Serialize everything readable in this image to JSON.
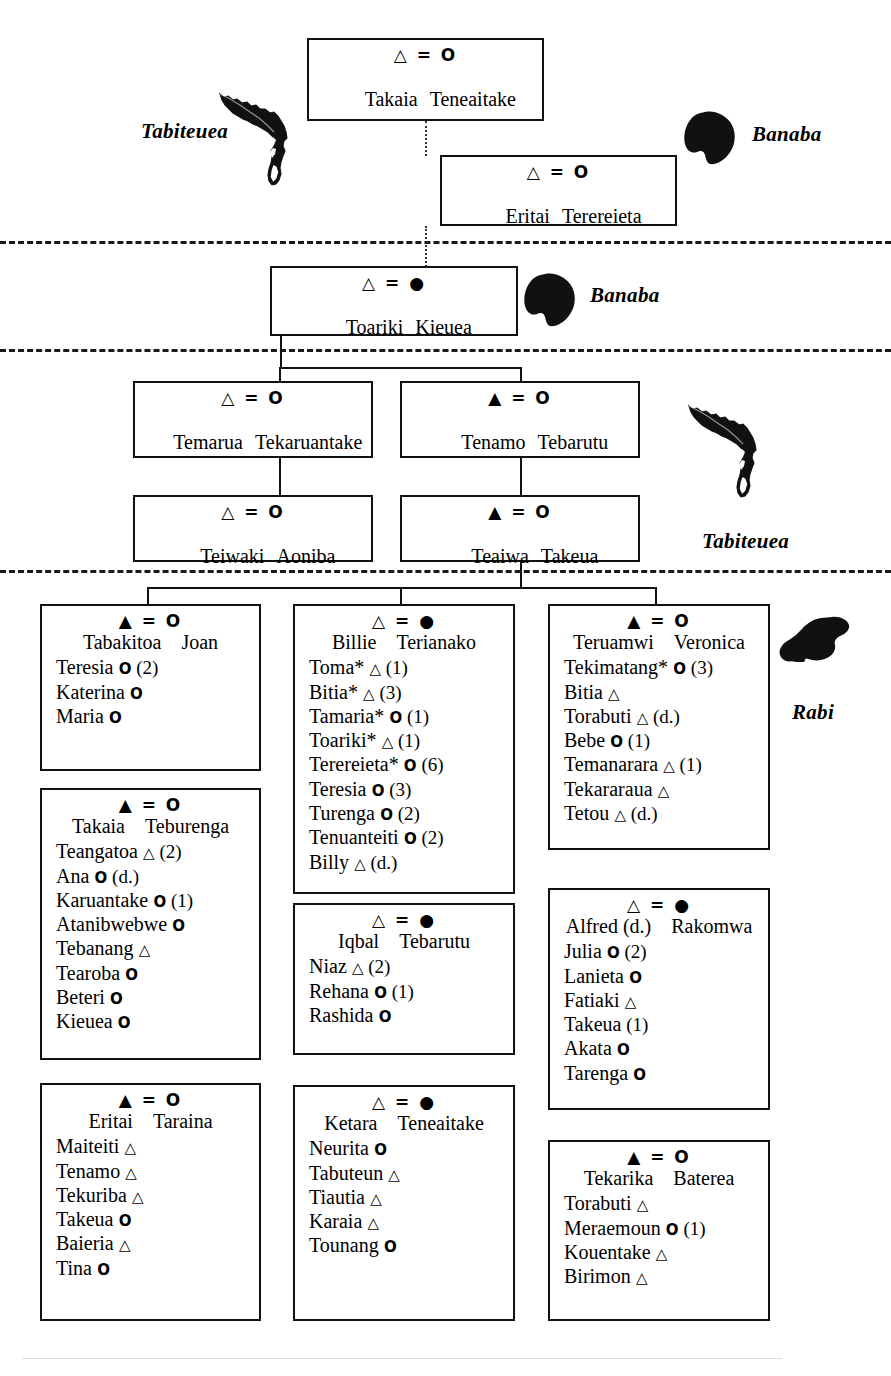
{
  "figure": {
    "type": "genealogy-chart",
    "symbols": {
      "male_open": "△",
      "male_filled": "▲",
      "female_open": "O",
      "female_filled": "●",
      "union": "="
    }
  },
  "islands": [
    {
      "name": "Tabiteuea",
      "shape": "tabiteuea",
      "position": "top-left"
    },
    {
      "name": "Banaba",
      "shape": "banaba",
      "position": "top-right"
    },
    {
      "name": "Banaba",
      "shape": "banaba",
      "position": "mid-right"
    },
    {
      "name": "Tabiteuea",
      "shape": "tabiteuea",
      "position": "lower-right"
    },
    {
      "name": "Rabi",
      "shape": "rabi",
      "position": "bottom-right"
    }
  ],
  "generations": [
    {
      "id": "gen1",
      "boxes": [
        {
          "id": "takaia-teneaitake",
          "husband_symbol": "△",
          "wife_symbol": "O",
          "husband": "Takaia",
          "wife": "Teneaitake",
          "children": []
        }
      ]
    },
    {
      "id": "gen2",
      "boxes": [
        {
          "id": "eritai-terereieta",
          "husband_symbol": "△",
          "wife_symbol": "O",
          "husband": "Eritai",
          "wife": "Terereieta",
          "children": []
        }
      ]
    },
    {
      "id": "gen3",
      "boxes": [
        {
          "id": "toariki-kieuea",
          "husband_symbol": "△",
          "wife_symbol": "●",
          "husband": "Toariki",
          "wife": "Kieuea",
          "children": []
        }
      ]
    },
    {
      "id": "gen4",
      "boxes": [
        {
          "id": "temarua-tekaruantake",
          "husband_symbol": "△",
          "wife_symbol": "O",
          "husband": "Temarua",
          "wife": "Tekaruantake",
          "children": []
        },
        {
          "id": "tenamo-tebarutu",
          "husband_symbol": "▲",
          "wife_symbol": "O",
          "husband": "Tenamo",
          "wife": "Tebarutu",
          "children": []
        }
      ]
    },
    {
      "id": "gen5",
      "boxes": [
        {
          "id": "teiwaki-aoniba",
          "husband_symbol": "△",
          "wife_symbol": "O",
          "husband": "Teiwaki",
          "wife": "Aoniba",
          "children": []
        },
        {
          "id": "teaiwa-takeua",
          "husband_symbol": "▲",
          "wife_symbol": "O",
          "husband": "Teaiwa",
          "wife": "Takeua",
          "children": []
        }
      ]
    },
    {
      "id": "gen6",
      "boxes": [
        {
          "id": "tabakitoa-joan",
          "husband_symbol": "▲",
          "wife_symbol": "O",
          "husband": "Tabakitoa",
          "wife": "Joan",
          "children": [
            {
              "name": "Teresia",
              "symbol": "O",
              "count": "(2)"
            },
            {
              "name": "Katerina",
              "symbol": "O",
              "count": ""
            },
            {
              "name": "Maria",
              "symbol": "O",
              "count": ""
            }
          ]
        },
        {
          "id": "takaia-teburenga",
          "husband_symbol": "▲",
          "wife_symbol": "O",
          "husband": "Takaia",
          "wife": "Teburenga",
          "children": [
            {
              "name": "Teangatoa",
              "symbol": "△",
              "count": "(2)"
            },
            {
              "name": "Ana",
              "symbol": "O",
              "count": "(d.)"
            },
            {
              "name": "Karuantake",
              "symbol": "O",
              "count": "(1)"
            },
            {
              "name": "Atanibwebwe",
              "symbol": "O",
              "count": ""
            },
            {
              "name": "Tebanang",
              "symbol": "△",
              "count": ""
            },
            {
              "name": "Tearoba",
              "symbol": "O",
              "count": ""
            },
            {
              "name": "Beteri",
              "symbol": "O",
              "count": ""
            },
            {
              "name": "Kieuea",
              "symbol": "O",
              "count": ""
            }
          ]
        },
        {
          "id": "eritai-taraina",
          "husband_symbol": "▲",
          "wife_symbol": "O",
          "husband": "Eritai",
          "wife": "Taraina",
          "children": [
            {
              "name": "Maiteiti",
              "symbol": "△",
              "count": ""
            },
            {
              "name": "Tenamo",
              "symbol": "△",
              "count": ""
            },
            {
              "name": "Tekuriba",
              "symbol": "△",
              "count": ""
            },
            {
              "name": "Takeua",
              "symbol": "O",
              "count": ""
            },
            {
              "name": "Baieria",
              "symbol": "△",
              "count": ""
            },
            {
              "name": "Tina",
              "symbol": "O",
              "count": ""
            }
          ]
        },
        {
          "id": "billie-terianako",
          "husband_symbol": "△",
          "wife_symbol": "●",
          "husband": "Billie",
          "wife": "Terianako",
          "children": [
            {
              "name": "Toma*",
              "symbol": "△",
              "count": "(1)"
            },
            {
              "name": "Bitia*",
              "symbol": "△",
              "count": "(3)"
            },
            {
              "name": "Tamaria*",
              "symbol": "O",
              "count": "(1)"
            },
            {
              "name": "Toariki*",
              "symbol": "△",
              "count": "(1)"
            },
            {
              "name": "Terereieta*",
              "symbol": "O",
              "count": "(6)"
            },
            {
              "name": "Teresia",
              "symbol": "O",
              "count": "(3)"
            },
            {
              "name": "Turenga",
              "symbol": "O",
              "count": "(2)"
            },
            {
              "name": "Tenuanteiti",
              "symbol": "O",
              "count": "(2)"
            },
            {
              "name": "Billy",
              "symbol": "△",
              "count": "(d.)"
            }
          ]
        },
        {
          "id": "iqbal-tebarutu",
          "husband_symbol": "△",
          "wife_symbol": "●",
          "husband": "Iqbal",
          "wife": "Tebarutu",
          "children": [
            {
              "name": "Niaz",
              "symbol": "△",
              "count": "(2)"
            },
            {
              "name": "Rehana",
              "symbol": "O",
              "count": "(1)"
            },
            {
              "name": "Rashida",
              "symbol": "O",
              "count": ""
            }
          ]
        },
        {
          "id": "ketara-teneaitake",
          "husband_symbol": "△",
          "wife_symbol": "●",
          "husband": "Ketara",
          "wife": "Teneaitake",
          "children": [
            {
              "name": "Neurita",
              "symbol": "O",
              "count": ""
            },
            {
              "name": "Tabuteun",
              "symbol": "△",
              "count": ""
            },
            {
              "name": "Tiautia",
              "symbol": "△",
              "count": ""
            },
            {
              "name": "Karaia",
              "symbol": "△",
              "count": ""
            },
            {
              "name": "Tounang",
              "symbol": "O",
              "count": ""
            }
          ]
        },
        {
          "id": "teruamwi-veronica",
          "husband_symbol": "▲",
          "wife_symbol": "O",
          "husband": "Teruamwi",
          "wife": "Veronica",
          "children": [
            {
              "name": "Tekimatang*",
              "symbol": "O",
              "count": "(3)"
            },
            {
              "name": "Bitia",
              "symbol": "△",
              "count": ""
            },
            {
              "name": "Torabuti",
              "symbol": "△",
              "count": "(d.)"
            },
            {
              "name": "Bebe",
              "symbol": "O",
              "count": "(1)"
            },
            {
              "name": "Temanarara",
              "symbol": "△",
              "count": "(1)"
            },
            {
              "name": "Tekararaua",
              "symbol": "△",
              "count": ""
            },
            {
              "name": "Tetou",
              "symbol": "△",
              "count": "(d.)"
            }
          ]
        },
        {
          "id": "alfred-rakomwa",
          "husband_symbol": "△",
          "wife_symbol": "●",
          "husband": "Alfred (d.)",
          "wife": "Rakomwa",
          "children": [
            {
              "name": "Julia",
              "symbol": "O",
              "count": "(2)"
            },
            {
              "name": "Lanieta",
              "symbol": "O",
              "count": ""
            },
            {
              "name": "Fatiaki",
              "symbol": "△",
              "count": ""
            },
            {
              "name": "Takeua",
              "symbol": "",
              "count": "(1)"
            },
            {
              "name": "Akata",
              "symbol": "O",
              "count": ""
            },
            {
              "name": "Tarenga",
              "symbol": "O",
              "count": ""
            }
          ]
        },
        {
          "id": "tekarika-baterea",
          "husband_symbol": "▲",
          "wife_symbol": "O",
          "husband": "Tekarika",
          "wife": "Baterea",
          "children": [
            {
              "name": "Torabuti",
              "symbol": "△",
              "count": ""
            },
            {
              "name": "Meraemoun",
              "symbol": "O",
              "count": "(1)"
            },
            {
              "name": "Kouentake",
              "symbol": "△",
              "count": ""
            },
            {
              "name": "Birimon",
              "symbol": "△",
              "count": ""
            }
          ]
        }
      ]
    }
  ]
}
